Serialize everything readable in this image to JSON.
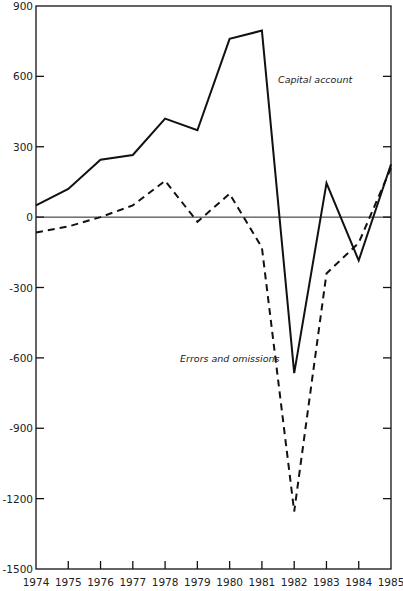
{
  "chart_data": {
    "type": "line",
    "title": "",
    "xlabel": "",
    "ylabel": "",
    "x": [
      1974,
      1975,
      1976,
      1977,
      1978,
      1979,
      1980,
      1981,
      1982,
      1983,
      1984,
      1985
    ],
    "ylim": [
      -1500,
      900
    ],
    "xlim": [
      1974,
      1985
    ],
    "yticks": [
      900,
      600,
      300,
      0,
      -300,
      -600,
      -900,
      -1200,
      -1500
    ],
    "xticks": [
      "1974",
      "1975",
      "1976",
      "1977",
      "1978",
      "1979",
      "1980",
      "1981",
      "1982",
      "1983",
      "1984",
      "1985"
    ],
    "grid": false,
    "zero_line": true,
    "legend": "inline annotations",
    "series": [
      {
        "name": "Capital account",
        "style": "solid",
        "values": [
          50,
          120,
          245,
          265,
          420,
          370,
          760,
          795,
          -665,
          145,
          -185,
          225
        ]
      },
      {
        "name": "Errors and omissions",
        "style": "dashed",
        "values": [
          -65,
          -40,
          0,
          50,
          155,
          -20,
          100,
          -130,
          -1255,
          -240,
          -110,
          210
        ]
      }
    ],
    "annotations": [
      {
        "text": "Capital account",
        "x": 1982.3,
        "y": 600
      },
      {
        "text": "Errors and omissions",
        "x": 1979.6,
        "y": -680
      }
    ]
  },
  "labels": {
    "capital_account": "Capital account",
    "errors_omissions": "Errors and omissions"
  }
}
